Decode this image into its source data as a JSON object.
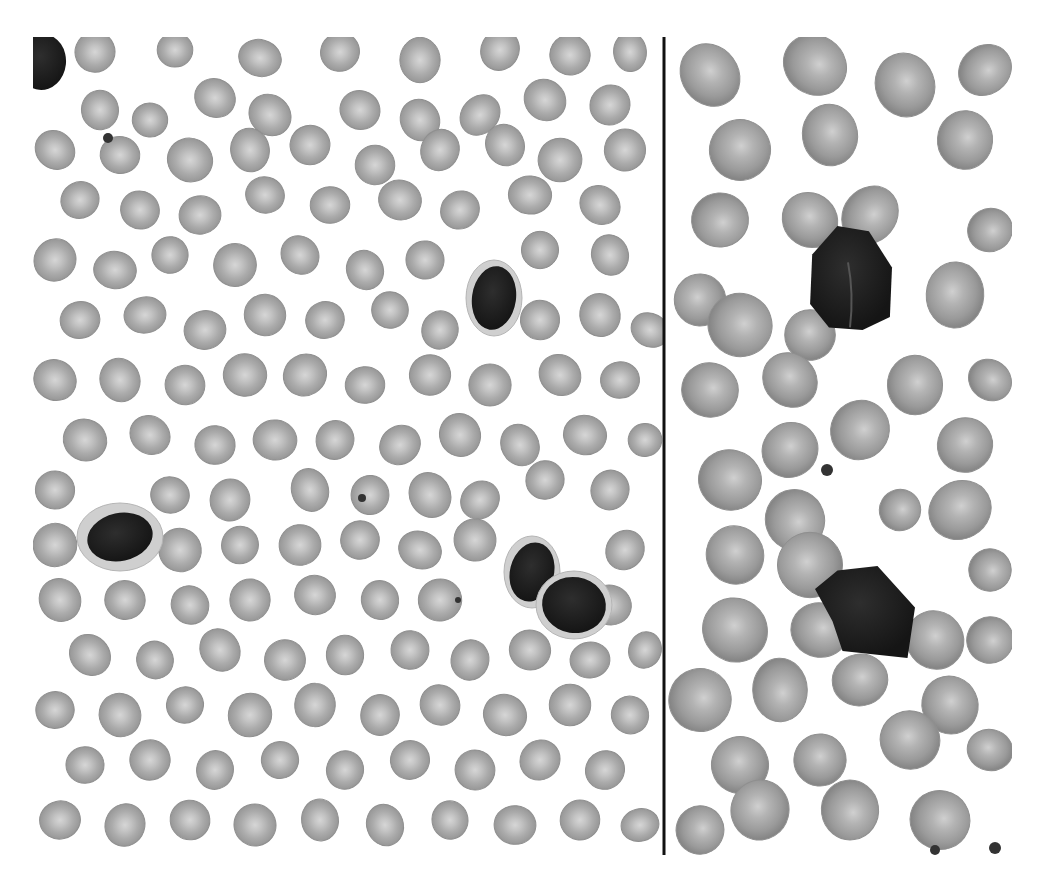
{
  "image": {
    "width": 1044,
    "height": 877,
    "background": "#ffffff",
    "description": "Grayscale peripheral blood smear micrograph, two panels separated by a vertical black line"
  },
  "frame": {
    "x": 33,
    "y": 37,
    "width": 979,
    "height": 818
  },
  "divider": {
    "x": 664,
    "y1": 37,
    "y2": 855,
    "color": "#111111",
    "width": 3
  },
  "colors": {
    "rbc_fill": "#a9a9a9",
    "rbc_edge": "#8f8f8f",
    "rbc_pallor": "#d6d6d6",
    "rbc_fill_right": "#9c9c9c",
    "nucleus": "#1c1c1c",
    "cytoplasm": "#cfcfcf"
  },
  "panels": [
    {
      "name": "left-panel",
      "x": 33,
      "y": 37,
      "width": 631,
      "height": 818,
      "rbcs": [
        [
          95,
          52,
          20
        ],
        [
          175,
          50,
          18
        ],
        [
          260,
          58,
          20
        ],
        [
          340,
          52,
          20
        ],
        [
          420,
          60,
          22
        ],
        [
          500,
          50,
          20
        ],
        [
          570,
          55,
          20
        ],
        [
          630,
          52,
          18
        ],
        [
          100,
          110,
          20
        ],
        [
          150,
          120,
          18
        ],
        [
          215,
          98,
          20
        ],
        [
          270,
          115,
          20
        ],
        [
          360,
          110,
          20
        ],
        [
          420,
          120,
          20
        ],
        [
          480,
          115,
          20
        ],
        [
          545,
          100,
          20
        ],
        [
          610,
          105,
          20
        ],
        [
          55,
          150,
          20
        ],
        [
          120,
          155,
          20
        ],
        [
          190,
          160,
          22
        ],
        [
          250,
          150,
          20
        ],
        [
          310,
          145,
          20
        ],
        [
          375,
          165,
          20
        ],
        [
          440,
          150,
          20
        ],
        [
          505,
          145,
          20
        ],
        [
          560,
          160,
          20
        ],
        [
          625,
          150,
          20
        ],
        [
          80,
          200,
          20
        ],
        [
          140,
          210,
          20
        ],
        [
          200,
          215,
          20
        ],
        [
          265,
          195,
          20
        ],
        [
          330,
          205,
          20
        ],
        [
          400,
          200,
          20
        ],
        [
          460,
          210,
          20
        ],
        [
          530,
          195,
          20
        ],
        [
          600,
          205,
          20
        ],
        [
          55,
          260,
          20
        ],
        [
          115,
          270,
          20
        ],
        [
          170,
          255,
          20
        ],
        [
          235,
          265,
          20
        ],
        [
          300,
          255,
          20
        ],
        [
          365,
          270,
          20
        ],
        [
          425,
          260,
          20
        ],
        [
          540,
          250,
          20
        ],
        [
          610,
          255,
          20
        ],
        [
          80,
          320,
          20
        ],
        [
          145,
          315,
          20
        ],
        [
          205,
          330,
          20
        ],
        [
          265,
          315,
          20
        ],
        [
          325,
          320,
          20
        ],
        [
          390,
          310,
          20
        ],
        [
          440,
          330,
          20
        ],
        [
          540,
          320,
          20
        ],
        [
          600,
          315,
          20
        ],
        [
          650,
          330,
          18
        ],
        [
          55,
          380,
          20
        ],
        [
          120,
          380,
          20
        ],
        [
          185,
          385,
          20
        ],
        [
          245,
          375,
          20
        ],
        [
          305,
          375,
          20
        ],
        [
          365,
          385,
          20
        ],
        [
          430,
          375,
          20
        ],
        [
          490,
          385,
          20
        ],
        [
          560,
          375,
          20
        ],
        [
          620,
          380,
          20
        ],
        [
          85,
          440,
          20
        ],
        [
          150,
          435,
          20
        ],
        [
          215,
          445,
          20
        ],
        [
          275,
          440,
          20
        ],
        [
          335,
          440,
          20
        ],
        [
          400,
          445,
          20
        ],
        [
          460,
          435,
          20
        ],
        [
          520,
          445,
          20
        ],
        [
          585,
          435,
          20
        ],
        [
          645,
          440,
          18
        ],
        [
          55,
          490,
          20
        ],
        [
          170,
          495,
          20
        ],
        [
          230,
          500,
          20
        ],
        [
          310,
          490,
          20
        ],
        [
          370,
          495,
          20
        ],
        [
          430,
          495,
          22
        ],
        [
          480,
          500,
          20
        ],
        [
          545,
          480,
          20
        ],
        [
          610,
          490,
          20
        ],
        [
          55,
          545,
          20
        ],
        [
          180,
          550,
          20
        ],
        [
          240,
          545,
          20
        ],
        [
          300,
          545,
          20
        ],
        [
          360,
          540,
          20
        ],
        [
          420,
          550,
          20
        ],
        [
          475,
          540,
          20
        ],
        [
          625,
          550,
          20
        ],
        [
          60,
          600,
          20
        ],
        [
          125,
          600,
          20
        ],
        [
          190,
          605,
          20
        ],
        [
          250,
          600,
          20
        ],
        [
          315,
          595,
          20
        ],
        [
          380,
          600,
          20
        ],
        [
          440,
          600,
          20
        ],
        [
          610,
          605,
          20
        ],
        [
          90,
          655,
          20
        ],
        [
          155,
          660,
          20
        ],
        [
          220,
          650,
          20
        ],
        [
          285,
          660,
          20
        ],
        [
          345,
          655,
          20
        ],
        [
          410,
          650,
          20
        ],
        [
          470,
          660,
          20
        ],
        [
          530,
          650,
          20
        ],
        [
          590,
          660,
          20
        ],
        [
          645,
          650,
          18
        ],
        [
          55,
          710,
          20
        ],
        [
          120,
          715,
          20
        ],
        [
          185,
          705,
          20
        ],
        [
          250,
          715,
          20
        ],
        [
          315,
          705,
          20
        ],
        [
          380,
          715,
          20
        ],
        [
          440,
          705,
          20
        ],
        [
          505,
          715,
          20
        ],
        [
          570,
          705,
          20
        ],
        [
          630,
          715,
          20
        ],
        [
          85,
          765,
          20
        ],
        [
          150,
          760,
          20
        ],
        [
          215,
          770,
          20
        ],
        [
          280,
          760,
          20
        ],
        [
          345,
          770,
          20
        ],
        [
          410,
          760,
          20
        ],
        [
          475,
          770,
          20
        ],
        [
          540,
          760,
          20
        ],
        [
          605,
          770,
          20
        ],
        [
          60,
          820,
          20
        ],
        [
          125,
          825,
          20
        ],
        [
          190,
          820,
          20
        ],
        [
          255,
          825,
          20
        ],
        [
          320,
          820,
          20
        ],
        [
          385,
          825,
          20
        ],
        [
          450,
          820,
          20
        ],
        [
          515,
          825,
          20
        ],
        [
          580,
          820,
          20
        ],
        [
          640,
          825,
          18
        ]
      ],
      "leukocytes": [
        {
          "name": "dark-cell-top-left-corner",
          "cx": 42,
          "cy": 62,
          "rx": 24,
          "ry": 28,
          "cyto": 0
        },
        {
          "name": "lymphocyte-center",
          "cx": 494,
          "cy": 298,
          "rx": 22,
          "ry": 32,
          "cyto": 6
        },
        {
          "name": "lymphocyte-left",
          "cx": 120,
          "cy": 537,
          "rx": 33,
          "ry": 24,
          "cyto": 10
        },
        {
          "name": "lymphocyte-pair-a",
          "cx": 532,
          "cy": 572,
          "rx": 22,
          "ry": 30,
          "cyto": 6
        },
        {
          "name": "lymphocyte-pair-b",
          "cx": 574,
          "cy": 605,
          "rx": 32,
          "ry": 28,
          "cyto": 6
        }
      ],
      "platelets": [
        [
          108,
          138,
          5
        ],
        [
          362,
          498,
          4
        ],
        [
          458,
          600,
          3
        ]
      ]
    },
    {
      "name": "right-panel",
      "x": 667,
      "y": 37,
      "width": 345,
      "height": 818,
      "rbcs": [
        [
          710,
          75,
          30
        ],
        [
          815,
          65,
          30
        ],
        [
          905,
          85,
          30
        ],
        [
          985,
          70,
          26
        ],
        [
          740,
          150,
          30
        ],
        [
          830,
          135,
          30
        ],
        [
          965,
          140,
          30
        ],
        [
          720,
          220,
          30
        ],
        [
          810,
          220,
          28
        ],
        [
          870,
          215,
          28
        ],
        [
          990,
          230,
          22
        ],
        [
          700,
          300,
          28
        ],
        [
          740,
          325,
          30
        ],
        [
          810,
          335,
          28
        ],
        [
          955,
          295,
          30
        ],
        [
          710,
          390,
          30
        ],
        [
          790,
          380,
          28
        ],
        [
          915,
          385,
          30
        ],
        [
          990,
          380,
          22
        ],
        [
          790,
          450,
          26
        ],
        [
          860,
          430,
          28
        ],
        [
          965,
          445,
          30
        ],
        [
          730,
          480,
          30
        ],
        [
          795,
          520,
          28
        ],
        [
          900,
          510,
          22
        ],
        [
          960,
          510,
          30
        ],
        [
          735,
          555,
          30
        ],
        [
          810,
          565,
          30
        ],
        [
          990,
          570,
          22
        ],
        [
          735,
          630,
          30
        ],
        [
          820,
          630,
          28
        ],
        [
          935,
          640,
          28
        ],
        [
          990,
          640,
          22
        ],
        [
          700,
          700,
          30
        ],
        [
          780,
          690,
          30
        ],
        [
          860,
          680,
          28
        ],
        [
          950,
          705,
          30
        ],
        [
          740,
          765,
          30
        ],
        [
          820,
          760,
          28
        ],
        [
          910,
          740,
          30
        ],
        [
          990,
          750,
          22
        ],
        [
          700,
          830,
          26
        ],
        [
          760,
          810,
          30
        ],
        [
          850,
          810,
          28
        ],
        [
          940,
          820,
          30
        ]
      ],
      "leukocytes": [
        {
          "name": "neutrophil-top-right",
          "cx": 850,
          "cy": 278,
          "rx": 42,
          "ry": 52,
          "cyto": 0,
          "shape": "bilobed"
        },
        {
          "name": "neutrophil-bottom-right",
          "cx": 865,
          "cy": 612,
          "rx": 50,
          "ry": 46,
          "cyto": 0,
          "shape": "angular"
        }
      ],
      "platelets": [
        [
          827,
          470,
          6
        ],
        [
          935,
          850,
          5
        ],
        [
          995,
          848,
          6
        ]
      ]
    }
  ]
}
